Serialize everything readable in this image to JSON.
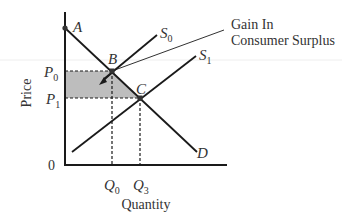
{
  "diagram": {
    "type": "supply-demand",
    "axes": {
      "y_label": "Price",
      "x_label": "Quantity",
      "origin_label": "0"
    },
    "price_ticks": [
      {
        "letter": "P",
        "sub": "0"
      },
      {
        "letter": "P",
        "sub": "1"
      }
    ],
    "quantity_ticks": [
      {
        "letter": "Q",
        "sub": "0"
      },
      {
        "letter": "Q",
        "sub": "3"
      }
    ],
    "curves": {
      "demand": {
        "letter": "D",
        "sub": ""
      },
      "supply_0": {
        "letter": "S",
        "sub": "0"
      },
      "supply_1": {
        "letter": "S",
        "sub": "1"
      }
    },
    "points": {
      "a": "A",
      "b": "B",
      "c": "C"
    },
    "annotation": {
      "line1": "Gain In",
      "line2": "Consumer Surplus"
    },
    "colors": {
      "line": "#1a1a1a",
      "shade": "#bdbdbd",
      "text": "#333333"
    }
  }
}
